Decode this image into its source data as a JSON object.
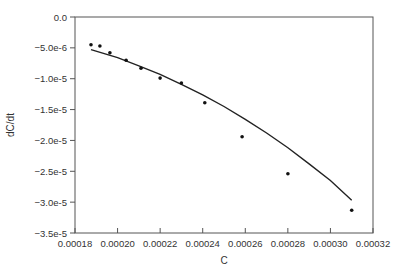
{
  "chart_data": {
    "type": "scatter",
    "title": "",
    "xlabel": "C",
    "ylabel": "dC/dt",
    "xlim": [
      0.00018,
      0.00032
    ],
    "ylim": [
      -3.5e-05,
      0.0
    ],
    "grid": false,
    "legend": null,
    "x_ticks": [
      "0.00018",
      "0.00020",
      "0.00022",
      "0.00024",
      "0.00026",
      "0.00028",
      "0.00030",
      "0.00032"
    ],
    "y_ticks": [
      "0.0",
      "-5.0e-6",
      "-1.0e-5",
      "-1.5e-5",
      "-2.0e-5",
      "-2.5e-5",
      "-3.0e-5",
      "-3.5e-5"
    ],
    "series": [
      {
        "name": "data",
        "kind": "scatter",
        "x": [
          0.0001875,
          0.0001917,
          0.0001964,
          0.000204,
          0.000211,
          0.00022,
          0.00023,
          0.000241,
          0.0002585,
          0.00028,
          0.00031
        ],
        "y": [
          -4.5e-06,
          -4.7e-06,
          -5.8e-06,
          -7e-06,
          -8.3e-06,
          -9.9e-06,
          -1.07e-05,
          -1.39e-05,
          -1.94e-05,
          -2.54e-05,
          -3.13e-05
        ]
      },
      {
        "name": "fit",
        "kind": "line",
        "x": [
          0.0001875,
          0.0002,
          0.00021,
          0.00022,
          0.00023,
          0.00024,
          0.00025,
          0.00026,
          0.00027,
          0.00028,
          0.00029,
          0.0003,
          0.00031
        ],
        "y": [
          -5.3e-06,
          -6.6e-06,
          -7.9e-06,
          -9.3e-06,
          -1.09e-05,
          -1.26e-05,
          -1.45e-05,
          -1.66e-05,
          -1.88e-05,
          -2.12e-05,
          -2.38e-05,
          -2.65e-05,
          -2.97e-05
        ]
      }
    ]
  },
  "colors": {
    "axis": "#555555",
    "marker": "#111111",
    "line": "#222222",
    "text": "#333333"
  }
}
